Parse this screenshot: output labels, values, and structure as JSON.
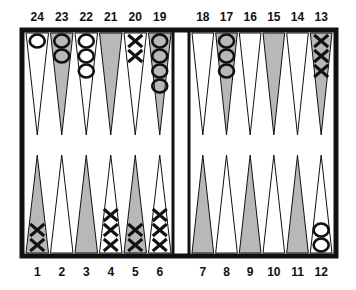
{
  "game": "backgammon",
  "colors": {
    "frame": "#111111",
    "light_point": "#ffffff",
    "dark_point": "#b8b8b8",
    "checker_stroke": "#111111"
  },
  "top_labels": [
    "24",
    "23",
    "22",
    "21",
    "20",
    "19",
    "18",
    "17",
    "16",
    "15",
    "14",
    "13"
  ],
  "bottom_labels": [
    "1",
    "2",
    "3",
    "4",
    "5",
    "6",
    "7",
    "8",
    "9",
    "10",
    "11",
    "12"
  ],
  "points": [
    {
      "n": 1,
      "shade": "dark",
      "player": "X",
      "count": 2
    },
    {
      "n": 2,
      "shade": "light",
      "player": "",
      "count": 0
    },
    {
      "n": 3,
      "shade": "dark",
      "player": "",
      "count": 0
    },
    {
      "n": 4,
      "shade": "light",
      "player": "X",
      "count": 3
    },
    {
      "n": 5,
      "shade": "dark",
      "player": "X",
      "count": 2
    },
    {
      "n": 6,
      "shade": "light",
      "player": "X",
      "count": 3
    },
    {
      "n": 7,
      "shade": "dark",
      "player": "",
      "count": 0
    },
    {
      "n": 8,
      "shade": "light",
      "player": "",
      "count": 0
    },
    {
      "n": 9,
      "shade": "dark",
      "player": "",
      "count": 0
    },
    {
      "n": 10,
      "shade": "light",
      "player": "",
      "count": 0
    },
    {
      "n": 11,
      "shade": "dark",
      "player": "",
      "count": 0
    },
    {
      "n": 12,
      "shade": "light",
      "player": "O",
      "count": 2
    },
    {
      "n": 13,
      "shade": "dark",
      "player": "X",
      "count": 3
    },
    {
      "n": 14,
      "shade": "light",
      "player": "",
      "count": 0
    },
    {
      "n": 15,
      "shade": "dark",
      "player": "",
      "count": 0
    },
    {
      "n": 16,
      "shade": "light",
      "player": "",
      "count": 0
    },
    {
      "n": 17,
      "shade": "dark",
      "player": "O",
      "count": 3
    },
    {
      "n": 18,
      "shade": "light",
      "player": "",
      "count": 0
    },
    {
      "n": 19,
      "shade": "dark",
      "player": "O",
      "count": 4
    },
    {
      "n": 20,
      "shade": "light",
      "player": "X",
      "count": 2
    },
    {
      "n": 21,
      "shade": "dark",
      "player": "",
      "count": 0
    },
    {
      "n": 22,
      "shade": "light",
      "player": "O",
      "count": 3
    },
    {
      "n": 23,
      "shade": "dark",
      "player": "O",
      "count": 2
    },
    {
      "n": 24,
      "shade": "light",
      "player": "O",
      "count": 1
    }
  ]
}
